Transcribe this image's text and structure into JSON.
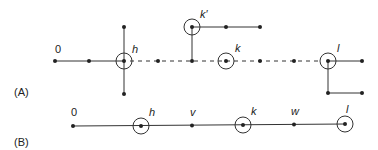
{
  "panels": [
    {
      "label": "(A)"
    },
    {
      "label": "(B)"
    }
  ],
  "panelA": {
    "nodes": {
      "zero": "0",
      "h": "h",
      "kprime": "k′",
      "k": "k",
      "l": "l"
    }
  },
  "panelB": {
    "nodes": [
      "0",
      "h",
      "v",
      "k",
      "w",
      "l"
    ],
    "circled": [
      "h",
      "k",
      "l"
    ]
  }
}
